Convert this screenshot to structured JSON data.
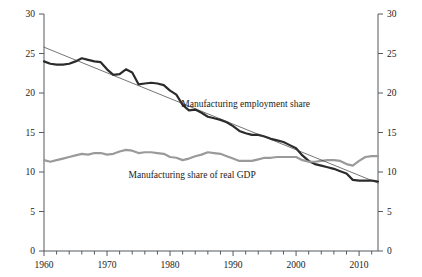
{
  "chart_data": {
    "type": "line",
    "title": "",
    "subtitle": "",
    "xlabel": "",
    "ylabel": "",
    "xlim": [
      1960,
      2013
    ],
    "ylim": [
      0,
      30
    ],
    "y_ticks": [
      0,
      5,
      10,
      15,
      20,
      25,
      30
    ],
    "y_ticks_right": [
      0,
      5,
      10,
      15,
      20,
      25,
      30
    ],
    "x_ticks_major": [
      1960,
      1970,
      1980,
      1990,
      2000,
      2010
    ],
    "x_tick_minor_step": 2,
    "grid": false,
    "legend_position": "inline-annotations",
    "axis_left_label_0": "0",
    "axis_left_label_5": "5",
    "axis_left_label_10": "10",
    "axis_left_label_15": "15",
    "axis_left_label_20": "20",
    "axis_left_label_25": "25",
    "axis_left_label_30": "30",
    "annotations": [
      {
        "name": "employment-share-label",
        "text": "Manufacturing employment share",
        "x": 1992.0,
        "y": 18.2
      },
      {
        "name": "gdp-share-label",
        "text": "Manufacturing share of real GDP",
        "x": 1983.5,
        "y": 9.3
      }
    ],
    "series": [
      {
        "name": "Manufacturing employment share",
        "color": "#2b2b2b",
        "width": 2.2,
        "x": [
          1960,
          1961,
          1962,
          1963,
          1964,
          1965,
          1966,
          1967,
          1968,
          1969,
          1970,
          1971,
          1972,
          1973,
          1974,
          1975,
          1976,
          1977,
          1978,
          1979,
          1980,
          1981,
          1982,
          1983,
          1984,
          1985,
          1986,
          1987,
          1988,
          1989,
          1990,
          1991,
          1992,
          1993,
          1994,
          1995,
          1996,
          1997,
          1998,
          1999,
          2000,
          2001,
          2002,
          2003,
          2004,
          2005,
          2006,
          2007,
          2008,
          2009,
          2010,
          2011,
          2012,
          2013
        ],
        "values": [
          24.0,
          23.7,
          23.6,
          23.6,
          23.7,
          24.0,
          24.4,
          24.2,
          24.0,
          23.9,
          23.0,
          22.3,
          22.4,
          23.0,
          22.6,
          21.1,
          21.2,
          21.3,
          21.2,
          21.0,
          20.3,
          19.8,
          18.5,
          17.8,
          17.9,
          17.5,
          17.0,
          16.8,
          16.6,
          16.3,
          15.8,
          15.2,
          14.9,
          14.7,
          14.7,
          14.5,
          14.2,
          14.0,
          13.8,
          13.4,
          13.0,
          12.1,
          11.4,
          11.0,
          10.8,
          10.6,
          10.4,
          10.1,
          9.8,
          9.0,
          8.9,
          8.9,
          8.9,
          8.8
        ]
      },
      {
        "name": "Manufacturing share of real GDP",
        "color": "#9a9a9a",
        "width": 2.2,
        "x": [
          1960,
          1961,
          1962,
          1963,
          1964,
          1965,
          1966,
          1967,
          1968,
          1969,
          1970,
          1971,
          1972,
          1973,
          1974,
          1975,
          1976,
          1977,
          1978,
          1979,
          1980,
          1981,
          1982,
          1983,
          1984,
          1985,
          1986,
          1987,
          1988,
          1989,
          1990,
          1991,
          1992,
          1993,
          1994,
          1995,
          1996,
          1997,
          1998,
          1999,
          2000,
          2001,
          2002,
          2003,
          2004,
          2005,
          2006,
          2007,
          2008,
          2009,
          2010,
          2011,
          2012,
          2013
        ],
        "values": [
          11.5,
          11.3,
          11.5,
          11.7,
          11.9,
          12.1,
          12.3,
          12.2,
          12.4,
          12.4,
          12.2,
          12.3,
          12.6,
          12.8,
          12.7,
          12.4,
          12.5,
          12.5,
          12.4,
          12.3,
          11.9,
          11.8,
          11.5,
          11.7,
          12.0,
          12.2,
          12.5,
          12.4,
          12.3,
          12.0,
          11.7,
          11.4,
          11.4,
          11.4,
          11.6,
          11.8,
          11.8,
          11.9,
          11.9,
          11.9,
          11.9,
          11.5,
          11.3,
          11.3,
          11.4,
          11.5,
          11.5,
          11.4,
          11.0,
          10.8,
          11.4,
          11.9,
          12.0,
          12.0
        ]
      },
      {
        "name": "Trend line (employment share)",
        "color": "#3a3a3a",
        "width": 0.7,
        "x": [
          1960,
          2013
        ],
        "values": [
          25.8,
          8.6
        ]
      }
    ]
  }
}
